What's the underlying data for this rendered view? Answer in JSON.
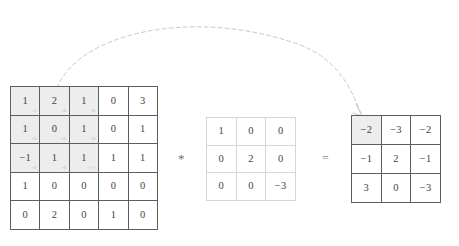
{
  "figure": {
    "type": "convolution-illustration",
    "operators": {
      "multiply": "*",
      "equals": "="
    },
    "arrow": {
      "name": "window-to-output-arrow",
      "style": "dashed-curved",
      "color": "#c2c2c2"
    }
  },
  "input_matrix": {
    "name": "input-feature-map",
    "rows": 5,
    "cols": 5,
    "values": [
      [
        "1",
        "2",
        "1",
        "0",
        "3"
      ],
      [
        "1",
        "0",
        "1",
        "0",
        "1"
      ],
      [
        "−1",
        "1",
        "1",
        "1",
        "1"
      ],
      [
        "1",
        "0",
        "0",
        "0",
        "0"
      ],
      [
        "0",
        "2",
        "0",
        "1",
        "0"
      ]
    ],
    "window": {
      "row_start": 0,
      "col_start": 0,
      "rows": 3,
      "cols": 3,
      "shade_color": "#ededed"
    },
    "multipliers": [
      [
        "×1",
        "×0",
        "×0"
      ],
      [
        "×0",
        "×2",
        "×0"
      ],
      [
        "×0",
        "×0",
        "×−3"
      ]
    ]
  },
  "kernel_matrix": {
    "name": "convolution-kernel",
    "rows": 3,
    "cols": 3,
    "values": [
      [
        "1",
        "0",
        "0"
      ],
      [
        "0",
        "2",
        "0"
      ],
      [
        "0",
        "0",
        "−3"
      ]
    ]
  },
  "output_matrix": {
    "name": "output-feature-map",
    "rows": 3,
    "cols": 3,
    "values": [
      [
        "−2",
        "−3",
        "−2"
      ],
      [
        "−1",
        "2",
        "−1"
      ],
      [
        "3",
        "0",
        "−3"
      ]
    ],
    "highlight": {
      "row": 0,
      "col": 0,
      "shade_color": "#ededed"
    }
  }
}
